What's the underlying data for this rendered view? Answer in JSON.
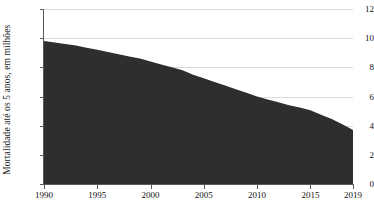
{
  "chart_data": {
    "type": "area",
    "title": "",
    "xlabel": "",
    "ylabel": "Mortalidade até os 5 anos, em milhões",
    "x": [
      1990,
      1991,
      1992,
      1993,
      1994,
      1995,
      1996,
      1997,
      1998,
      1999,
      2000,
      2001,
      2002,
      2003,
      2004,
      2005,
      2006,
      2007,
      2008,
      2009,
      2010,
      2011,
      2012,
      2013,
      2014,
      2015,
      2016,
      2017,
      2018,
      2019
    ],
    "values": [
      9.8,
      9.7,
      9.6,
      9.5,
      9.35,
      9.2,
      9.05,
      8.9,
      8.75,
      8.6,
      8.4,
      8.2,
      8.0,
      7.8,
      7.5,
      7.25,
      7.0,
      6.75,
      6.5,
      6.25,
      6.0,
      5.8,
      5.6,
      5.4,
      5.25,
      5.05,
      4.75,
      4.45,
      4.1,
      3.7
    ],
    "series": [
      {
        "name": "Mortalidade até os 5 anos",
        "values": [
          9.8,
          9.7,
          9.6,
          9.5,
          9.35,
          9.2,
          9.05,
          8.9,
          8.75,
          8.6,
          8.4,
          8.2,
          8.0,
          7.8,
          7.5,
          7.25,
          7.0,
          6.75,
          6.5,
          6.25,
          6.0,
          5.8,
          5.6,
          5.4,
          5.25,
          5.05,
          4.75,
          4.45,
          4.1,
          3.7
        ],
        "color": "#2e2e2e"
      }
    ],
    "xlim": [
      1990,
      2019
    ],
    "ylim": [
      0,
      12
    ],
    "y_ticks": [
      0,
      2,
      4,
      6,
      8,
      10,
      12
    ],
    "y_tick_labels": [
      "0",
      "2",
      "4",
      "6",
      "8",
      "10",
      "12"
    ],
    "x_ticks": [
      1990,
      1995,
      2000,
      2005,
      2010,
      2015,
      2019
    ],
    "x_tick_labels": [
      "1990",
      "1995",
      "2000",
      "2005",
      "2010",
      "2015",
      "2019"
    ],
    "grid": true,
    "grid_axis": "y",
    "grid_color": "#d9d9d9",
    "legend": false,
    "legend_position": "none",
    "fill_color": "#2e2e2e",
    "axis_color": "#5a5a5a",
    "background_color": "#ffffff",
    "annotations": []
  }
}
